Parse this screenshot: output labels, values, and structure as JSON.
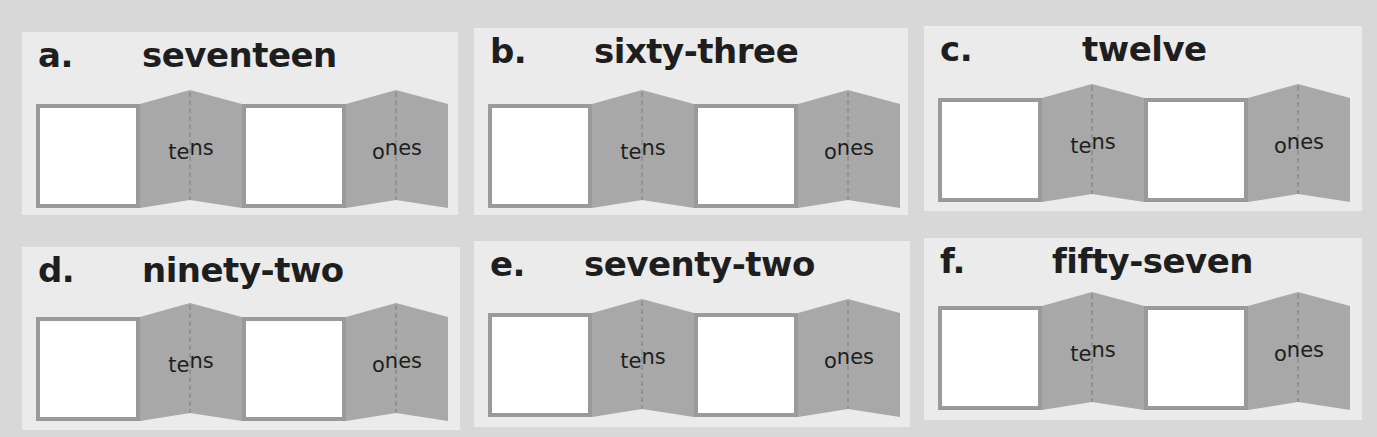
{
  "colors": {
    "page_background": "#d8d8d8",
    "panel_background": "#ebebeb",
    "box_border": "#9a9a9a",
    "fold_fill": "#a8a8a8",
    "text": "#1e1e1e"
  },
  "labels": {
    "tens_first": "te",
    "tens_rest": "ns",
    "ones_first": "o",
    "ones_rest": "nes"
  },
  "problems": [
    {
      "letter": "a.",
      "word": "seventeen"
    },
    {
      "letter": "b.",
      "word": "sixty-three"
    },
    {
      "letter": "c.",
      "word": "twelve"
    },
    {
      "letter": "d.",
      "word": "ninety-two"
    },
    {
      "letter": "e.",
      "word": "seventy-two"
    },
    {
      "letter": "f.",
      "word": "fifty-seven"
    }
  ]
}
